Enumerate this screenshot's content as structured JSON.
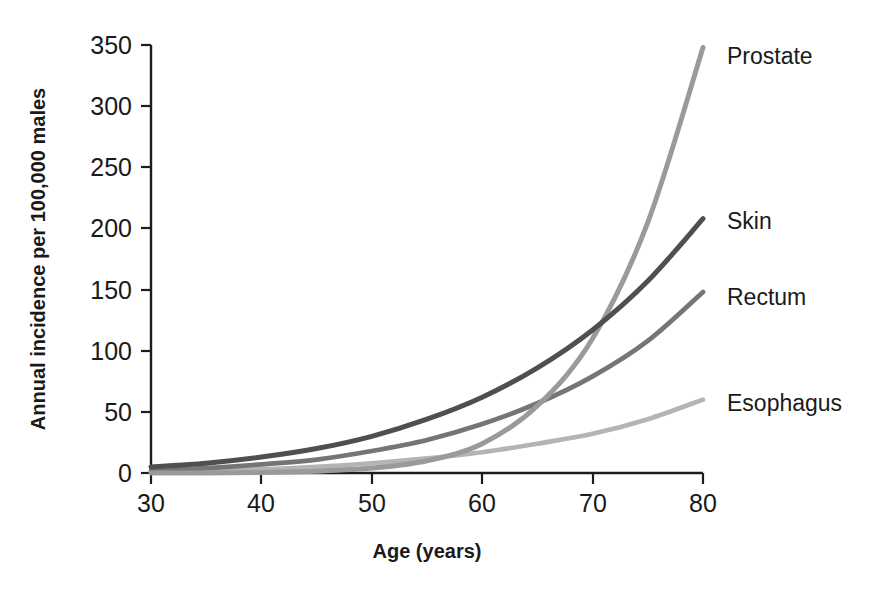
{
  "chart_data": {
    "type": "line",
    "title": "",
    "subtitle": "",
    "xlabel": "Age (years)",
    "ylabel": "Annual incidence per 100,000 males",
    "xlim": [
      30,
      80
    ],
    "ylim": [
      0,
      350
    ],
    "xticks": [
      30,
      40,
      50,
      60,
      70,
      80
    ],
    "yticks": [
      0,
      50,
      100,
      150,
      200,
      250,
      300,
      350
    ],
    "xtick_labels": [
      "30",
      "40",
      "50",
      "60",
      "70",
      "80"
    ],
    "ytick_labels": [
      "0",
      "50",
      "100",
      "150",
      "200",
      "250",
      "300",
      "350"
    ],
    "grid": false,
    "legend_position": "right-of-curve-ends",
    "x": [
      30,
      35,
      40,
      45,
      50,
      55,
      60,
      65,
      70,
      75,
      80
    ],
    "series": [
      {
        "name": "Prostate",
        "color": "#9a9a9a",
        "label": "Prostate",
        "values": [
          0,
          0,
          0.5,
          1.5,
          4,
          10,
          24,
          55,
          110,
          205,
          348
        ]
      },
      {
        "name": "Skin",
        "color": "#4f4f4f",
        "label": "Skin",
        "values": [
          5,
          8,
          13,
          20,
          30,
          44,
          62,
          86,
          117,
          157,
          208
        ]
      },
      {
        "name": "Rectum",
        "color": "#757575",
        "label": "Rectum",
        "values": [
          2,
          4,
          7,
          11,
          18,
          27,
          40,
          57,
          79,
          108,
          148
        ]
      },
      {
        "name": "Esophagus",
        "color": "#b4b4b4",
        "label": "Esophagus",
        "values": [
          1,
          2,
          3,
          5,
          8,
          12,
          17,
          24,
          32,
          44,
          60
        ]
      }
    ]
  },
  "axes": {
    "y_axis_title": "Annual incidence per 100,000 males",
    "x_axis_title": "Age (years)"
  },
  "labels": {
    "prostate": "Prostate",
    "skin": "Skin",
    "rectum": "Rectum",
    "esophagus": "Esophagus"
  },
  "colors": {
    "axis": "#1c1c1c",
    "text": "#1a1a1a",
    "background": "#ffffff",
    "prostate": "#9a9a9a",
    "skin": "#4f4f4f",
    "rectum": "#757575",
    "esophagus": "#b4b4b4"
  }
}
